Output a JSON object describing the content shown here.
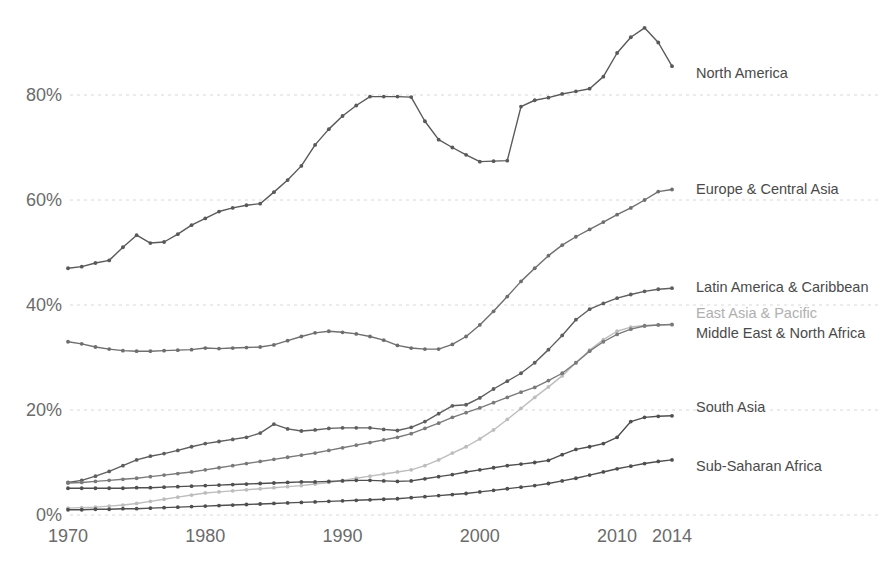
{
  "chart_data": {
    "type": "line",
    "title": "",
    "subtitle": "",
    "xlabel": "",
    "ylabel": "",
    "xlim": [
      1970,
      2014
    ],
    "ylim": [
      0,
      100
    ],
    "grid": true,
    "legend_position": "right-inline-labels",
    "y_ticks": [
      0,
      20,
      40,
      60,
      80
    ],
    "y_tick_labels": [
      "0%",
      "20%",
      "40%",
      "60%",
      "80%"
    ],
    "x_ticks": [
      1970,
      1980,
      1990,
      2000,
      2010,
      2014
    ],
    "x_tick_labels": [
      "1970",
      "1980",
      "1990",
      "2000",
      "2010",
      "2014"
    ],
    "x": [
      1970,
      1971,
      1972,
      1973,
      1974,
      1975,
      1976,
      1977,
      1978,
      1979,
      1980,
      1981,
      1982,
      1983,
      1984,
      1985,
      1986,
      1987,
      1988,
      1989,
      1990,
      1991,
      1992,
      1993,
      1994,
      1995,
      1996,
      1997,
      1998,
      1999,
      2000,
      2001,
      2002,
      2003,
      2004,
      2005,
      2006,
      2007,
      2008,
      2009,
      2010,
      2011,
      2012,
      2013,
      2014
    ],
    "series": [
      {
        "name": "North America",
        "color": "#595959",
        "label_color": "#4a4a4a",
        "values": [
          47.0,
          47.3,
          48.0,
          48.5,
          51.0,
          53.3,
          51.8,
          52.0,
          53.5,
          55.2,
          56.5,
          57.8,
          58.5,
          59.0,
          59.3,
          61.5,
          63.8,
          66.5,
          70.5,
          73.5,
          76.0,
          78.0,
          79.7,
          79.7,
          79.7,
          79.6,
          75.0,
          71.5,
          70.0,
          68.6,
          67.3,
          67.4,
          67.5,
          77.8,
          79.0,
          79.5,
          80.2,
          80.7,
          81.2,
          83.5,
          88.0,
          91.0,
          92.8,
          90.0,
          85.5
        ]
      },
      {
        "name": "Europe & Central Asia",
        "color": "#6e6e6e",
        "label_color": "#4a4a4a",
        "values": [
          33.0,
          32.6,
          32.0,
          31.6,
          31.3,
          31.2,
          31.2,
          31.3,
          31.4,
          31.5,
          31.8,
          31.7,
          31.8,
          31.9,
          32.0,
          32.4,
          33.2,
          34.0,
          34.7,
          35.0,
          34.8,
          34.5,
          34.0,
          33.3,
          32.3,
          31.8,
          31.6,
          31.6,
          32.5,
          34.0,
          36.2,
          38.8,
          41.6,
          44.5,
          47.0,
          49.4,
          51.4,
          53.0,
          54.4,
          55.8,
          57.2,
          58.5,
          60.0,
          61.6,
          62.0
        ]
      },
      {
        "name": "Latin America & Caribbean",
        "color": "#5e5e5e",
        "label_color": "#4a4a4a",
        "values": [
          6.2,
          6.6,
          7.4,
          8.3,
          9.4,
          10.5,
          11.2,
          11.7,
          12.3,
          13.0,
          13.6,
          14.0,
          14.4,
          14.8,
          15.6,
          17.3,
          16.4,
          16.0,
          16.2,
          16.5,
          16.6,
          16.6,
          16.6,
          16.3,
          16.1,
          16.7,
          17.8,
          19.3,
          20.8,
          21.0,
          22.3,
          24.0,
          25.5,
          27.0,
          29.0,
          31.5,
          34.2,
          37.2,
          39.2,
          40.3,
          41.3,
          42.0,
          42.6,
          43.0,
          43.2
        ]
      },
      {
        "name": "East Asia & Pacific",
        "color": "#bdbdbd",
        "label_color": "#b0b0b0",
        "values": [
          1.3,
          1.4,
          1.5,
          1.7,
          1.9,
          2.2,
          2.6,
          3.0,
          3.4,
          3.8,
          4.2,
          4.4,
          4.6,
          4.8,
          5.0,
          5.2,
          5.4,
          5.6,
          5.9,
          6.2,
          6.6,
          7.0,
          7.4,
          7.8,
          8.2,
          8.6,
          9.4,
          10.5,
          11.8,
          13.0,
          14.5,
          16.2,
          18.2,
          20.3,
          22.4,
          24.4,
          26.5,
          29.0,
          31.4,
          33.4,
          35.0,
          35.8,
          36.1,
          36.2,
          36.2
        ]
      },
      {
        "name": "Middle East & North Africa",
        "color": "#7a7a7a",
        "label_color": "#4a4a4a",
        "values": [
          6.1,
          6.2,
          6.4,
          6.6,
          6.8,
          7.0,
          7.3,
          7.6,
          7.9,
          8.2,
          8.6,
          9.0,
          9.4,
          9.8,
          10.2,
          10.6,
          11.0,
          11.4,
          11.8,
          12.3,
          12.8,
          13.3,
          13.8,
          14.3,
          14.8,
          15.5,
          16.5,
          17.5,
          18.6,
          19.5,
          20.4,
          21.4,
          22.4,
          23.4,
          24.3,
          25.6,
          27.0,
          29.0,
          31.2,
          33.0,
          34.4,
          35.4,
          36.0,
          36.2,
          36.3
        ]
      },
      {
        "name": "South Asia",
        "color": "#4f4f4f",
        "label_color": "#4a4a4a",
        "values": [
          5.1,
          5.1,
          5.1,
          5.1,
          5.1,
          5.2,
          5.2,
          5.3,
          5.4,
          5.5,
          5.6,
          5.7,
          5.8,
          5.9,
          6.0,
          6.1,
          6.2,
          6.3,
          6.3,
          6.4,
          6.5,
          6.6,
          6.6,
          6.5,
          6.4,
          6.5,
          6.9,
          7.3,
          7.7,
          8.2,
          8.6,
          9.0,
          9.4,
          9.7,
          10.0,
          10.4,
          11.5,
          12.5,
          13.0,
          13.6,
          14.8,
          17.8,
          18.6,
          18.8,
          18.9
        ]
      },
      {
        "name": "Sub-Saharan Africa",
        "color": "#4f4f4f",
        "label_color": "#4a4a4a",
        "values": [
          1.0,
          1.0,
          1.1,
          1.1,
          1.2,
          1.2,
          1.3,
          1.4,
          1.5,
          1.6,
          1.7,
          1.8,
          1.9,
          2.0,
          2.1,
          2.2,
          2.3,
          2.4,
          2.5,
          2.6,
          2.7,
          2.8,
          2.9,
          3.0,
          3.1,
          3.3,
          3.5,
          3.7,
          3.9,
          4.1,
          4.4,
          4.7,
          5.0,
          5.3,
          5.6,
          6.0,
          6.5,
          7.0,
          7.6,
          8.2,
          8.8,
          9.3,
          9.8,
          10.2,
          10.5
        ]
      }
    ],
    "annotations": [
      {
        "text": "North America",
        "series": "North America",
        "x": 696,
        "y": 74
      },
      {
        "text": "Europe & Central Asia",
        "series": "Europe & Central Asia",
        "x": 696,
        "y": 190
      },
      {
        "text": "Latin America & Caribbean",
        "series": "Latin America & Caribbean",
        "x": 696,
        "y": 288
      },
      {
        "text": "East Asia & Pacific",
        "series": "East Asia & Pacific",
        "x": 696,
        "y": 314
      },
      {
        "text": "Middle East & North Africa",
        "series": "Middle East & North Africa",
        "x": 696,
        "y": 334
      },
      {
        "text": "South Asia",
        "series": "South Asia",
        "x": 696,
        "y": 408
      },
      {
        "text": "Sub-Saharan Africa",
        "series": "Sub-Saharan Africa",
        "x": 696,
        "y": 467
      }
    ]
  },
  "axes": {
    "y_labels": [
      "80%",
      "60%",
      "40%",
      "20%",
      "0%"
    ],
    "x_labels": [
      "1970",
      "1980",
      "1990",
      "2000",
      "2010",
      "2014"
    ]
  },
  "colors": {
    "background": "#ffffff",
    "gridline": "#d8d8d8",
    "tick_text": "#6b6b6b",
    "label_text": "#4a4a4a",
    "muted_label_text": "#b0b0b0"
  }
}
